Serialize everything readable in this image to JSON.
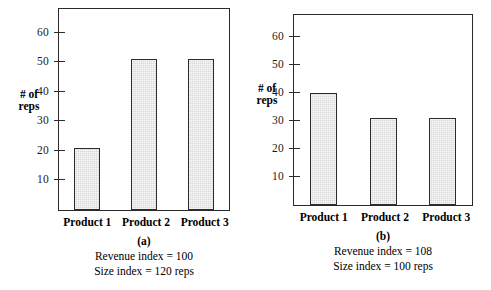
{
  "figure": {
    "panels": [
      {
        "id": "a",
        "caption_letter": "(a)",
        "caption_lines": [
          "Revenue index = 100",
          "Size index = 120 reps"
        ],
        "axis_title": "# of\nreps",
        "axis_title_line1": "# of",
        "axis_title_line2": "reps"
      },
      {
        "id": "b",
        "caption_letter": "(b)",
        "caption_lines": [
          "Revenue index = 108",
          "Size index = 100 reps"
        ],
        "axis_title_line1": "# of",
        "axis_title_line2": "reps"
      }
    ]
  },
  "chart_data": [
    {
      "type": "bar",
      "panel": "a",
      "title": "(a)",
      "categories": [
        "Product 1",
        "Product 2",
        "Product 3"
      ],
      "values": [
        21,
        51,
        51
      ],
      "xlabel": "",
      "ylabel": "# of reps",
      "ylim": [
        0,
        68
      ],
      "yticks": [
        10,
        20,
        30,
        40,
        50,
        60
      ],
      "ytick_labels": [
        "10",
        "20",
        "30",
        "40",
        "50",
        "60"
      ],
      "grid": false,
      "legend": "none",
      "bar_fill": "#d9d9d9",
      "bar_edge": "#2b2b2b",
      "annotations": [
        "Revenue index = 100",
        "Size index = 120 reps"
      ]
    },
    {
      "type": "bar",
      "panel": "b",
      "title": "(b)",
      "categories": [
        "Product 1",
        "Product 2",
        "Product 3"
      ],
      "values": [
        40,
        31,
        31
      ],
      "xlabel": "",
      "ylabel": "# of reps",
      "ylim": [
        0,
        68
      ],
      "yticks": [
        10,
        20,
        30,
        40,
        50,
        60
      ],
      "ytick_labels": [
        "10",
        "20",
        "30",
        "40",
        "50",
        "60"
      ],
      "grid": false,
      "legend": "none",
      "bar_fill": "#d9d9d9",
      "bar_edge": "#2b2b2b",
      "annotations": [
        "Revenue index = 108",
        "Size index = 100 reps"
      ]
    }
  ]
}
